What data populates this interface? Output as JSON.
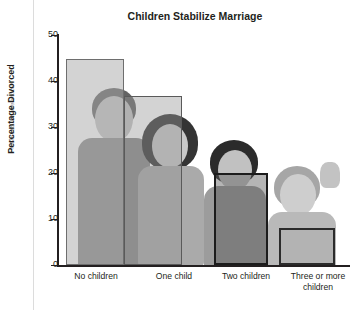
{
  "credit": "© MaszS/Shutterstock",
  "chart_data": {
    "type": "bar",
    "title": "Children Stabilize Marriage",
    "xlabel": "",
    "ylabel": "Percentage Divorced",
    "categories": [
      "No children",
      "One child",
      "Two children",
      "Three or more children"
    ],
    "values": [
      45,
      37,
      20,
      8
    ],
    "ylim": [
      0,
      50
    ],
    "yticks": [
      0,
      10,
      20,
      30,
      40,
      50
    ],
    "ytick_labels": [
      "0",
      "10",
      "20",
      "30",
      "40",
      "50"
    ],
    "grid": false,
    "legend": false,
    "background_image": "photograph of four children (grayscale) behind bars"
  }
}
